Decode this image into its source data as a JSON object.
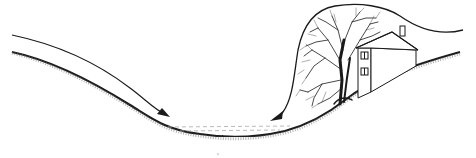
{
  "diagram": {
    "title": "",
    "elements": [
      {
        "id": "left-slope",
        "label": ""
      },
      {
        "id": "valley-floor",
        "label": ""
      },
      {
        "id": "right-slope",
        "label": ""
      },
      {
        "id": "left-airflow-arrow",
        "label": ""
      },
      {
        "id": "right-airflow-arrow",
        "label": ""
      },
      {
        "id": "tree",
        "label": ""
      },
      {
        "id": "house",
        "label": ""
      }
    ],
    "colors": {
      "ink": "#1a1a1a",
      "background": "#ffffff",
      "stipple": "#555555"
    }
  }
}
